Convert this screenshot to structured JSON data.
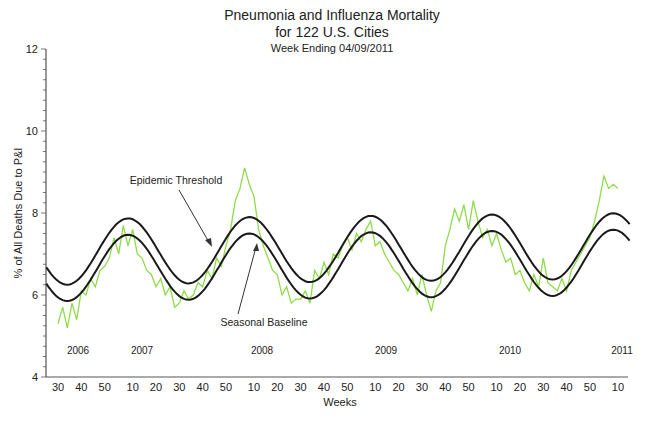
{
  "chart_data": {
    "type": "line",
    "title": "Pneumonia and Influenza Mortality",
    "title_line2": "for 122 U.S. Cities",
    "subtitle": "Week Ending 04/09/2011",
    "xlabel": "Weeks",
    "ylabel": "% of All Deaths Due to P&I",
    "ylim": [
      4,
      12
    ],
    "yticks": [
      4,
      6,
      8,
      10,
      12
    ],
    "ytick_labels": [
      "4",
      "6",
      "8",
      "10",
      "12"
    ],
    "xtick_labels": [
      "30",
      "40",
      "50",
      "10",
      "20",
      "30",
      "40",
      "50",
      "10",
      "20",
      "30",
      "40",
      "50",
      "10",
      "20",
      "30",
      "40",
      "50",
      "10",
      "20",
      "30",
      "40",
      "50",
      "10"
    ],
    "year_labels": [
      "2006",
      "2007",
      "2008",
      "2009",
      "2010",
      "2011"
    ],
    "grid": false,
    "legend": "none",
    "annotations": [
      "Epidemic Threshold",
      "Seasonal Baseline"
    ],
    "series": [
      {
        "name": "Epidemic Threshold",
        "color": "#1a1a1a",
        "description": "Sinusoid, peaks ~7.8-8.0% near week 8-10 each year, troughs ~6.1-6.4% near week 35-38",
        "x_weeks_from_2006w30": [
          0,
          30,
          60,
          82,
          110,
          134,
          162,
          186,
          214,
          238
        ],
        "values": [
          6.1,
          7.8,
          6.3,
          7.9,
          6.4,
          7.9,
          6.4,
          8.0,
          6.5,
          7.9
        ]
      },
      {
        "name": "Seasonal Baseline",
        "color": "#1a1a1a",
        "description": "Sinusoid ~0.4% below threshold",
        "x_weeks_from_2006w30": [
          0,
          30,
          60,
          82,
          110,
          134,
          162,
          186,
          214,
          238
        ],
        "values": [
          5.7,
          7.4,
          5.9,
          7.5,
          6.0,
          7.5,
          6.0,
          7.6,
          6.1,
          7.5
        ]
      },
      {
        "name": "Observed P&I %",
        "color": "#8fdc4a",
        "x_weeks_from_2006w30": [
          0,
          2,
          4,
          6,
          8,
          10,
          12,
          14,
          16,
          18,
          20,
          22,
          24,
          26,
          28,
          30,
          32,
          34,
          36,
          38,
          40,
          42,
          44,
          46,
          48,
          50,
          52,
          54,
          56,
          58,
          60,
          62,
          64,
          66,
          68,
          70,
          72,
          74,
          76,
          78,
          80,
          82,
          84,
          86,
          88,
          90,
          92,
          94,
          96,
          98,
          100,
          102,
          104,
          106,
          108,
          110,
          112,
          114,
          116,
          118,
          120,
          122,
          124,
          126,
          128,
          130,
          132,
          134,
          136,
          138,
          140,
          142,
          144,
          146,
          148,
          150,
          152,
          154,
          156,
          158,
          160,
          162,
          164,
          166,
          168,
          170,
          172,
          174,
          176,
          178,
          180,
          182,
          184,
          186,
          188,
          190,
          192,
          194,
          196,
          198,
          200,
          202,
          204,
          206,
          208,
          210,
          212,
          214,
          216,
          218,
          220,
          222,
          224,
          226,
          228,
          230,
          232,
          234,
          236,
          238,
          240
        ],
        "values": [
          5.3,
          5.7,
          5.2,
          5.8,
          5.4,
          6.1,
          6.0,
          6.4,
          6.2,
          6.6,
          6.7,
          6.9,
          7.4,
          7.0,
          7.7,
          7.2,
          7.6,
          7.0,
          6.9,
          6.6,
          6.5,
          6.2,
          6.4,
          6.0,
          6.2,
          5.7,
          5.8,
          6.1,
          5.9,
          6.0,
          6.3,
          6.2,
          6.6,
          6.4,
          6.9,
          6.7,
          7.2,
          7.6,
          8.3,
          8.6,
          9.1,
          8.7,
          8.4,
          7.6,
          7.2,
          6.9,
          6.6,
          6.5,
          6.0,
          6.2,
          5.8,
          5.9,
          5.9,
          6.1,
          5.8,
          6.6,
          6.4,
          6.8,
          6.5,
          7.0,
          6.9,
          7.2,
          7.4,
          7.1,
          7.5,
          7.3,
          7.6,
          7.8,
          7.2,
          7.3,
          7.0,
          6.8,
          6.6,
          6.5,
          6.3,
          6.1,
          6.4,
          6.0,
          6.5,
          6.0,
          5.6,
          6.1,
          6.3,
          7.2,
          7.6,
          8.1,
          7.8,
          8.2,
          7.6,
          8.3,
          7.8,
          7.4,
          7.6,
          7.2,
          7.5,
          7.1,
          6.8,
          6.9,
          6.5,
          6.6,
          6.3,
          6.1,
          6.5,
          6.2,
          6.9,
          6.3,
          6.2,
          6.1,
          6.4,
          6.1,
          6.6,
          6.8,
          7.0,
          7.2,
          7.4,
          7.8,
          8.3,
          8.9,
          8.6,
          8.7,
          8.6
        ]
      }
    ]
  }
}
